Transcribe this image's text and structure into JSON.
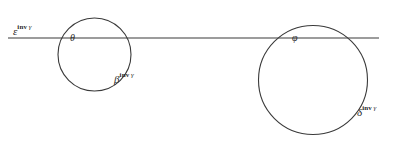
{
  "figure": {
    "width": 400,
    "height": 142,
    "background_color": "#ffffff",
    "stroke_color": "#3a3a3a",
    "text_color": "#2b2b2b"
  },
  "line": {
    "name": "horizontal-line",
    "x1": 8,
    "y1": 38,
    "x2": 379,
    "y2": 38
  },
  "circles": [
    {
      "name": "left-circle",
      "cx": 94.5,
      "cy": 54.5,
      "r": 36.5
    },
    {
      "name": "right-circle",
      "cx": 313,
      "cy": 80,
      "r": 54.5
    }
  ],
  "labels": {
    "epsilon": {
      "base": "ε",
      "sup": "inv",
      "sup_gamma": "γ",
      "full": "ε inv γ"
    },
    "theta": {
      "base": "θ",
      "sup": "",
      "sup_gamma": "",
      "full": "θ"
    },
    "beta": {
      "base": "β",
      "sup": "inv",
      "sup_gamma": "γ",
      "full": "β inv γ"
    },
    "phi": {
      "base": "φ",
      "sup": "",
      "sup_gamma": "",
      "full": "φ"
    },
    "delta": {
      "base": "δ",
      "sup": "inv",
      "sup_gamma": "γ",
      "full": "δ inv γ"
    }
  }
}
